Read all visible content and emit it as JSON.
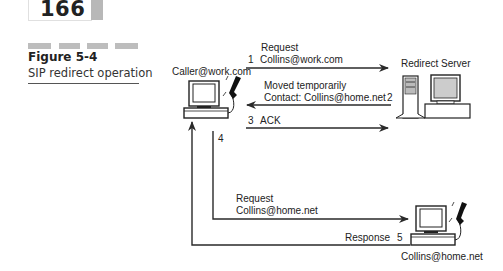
{
  "page": {
    "number": "166"
  },
  "figure": {
    "label": "Figure 5-4",
    "caption": "SIP redirect operation"
  },
  "nodes": {
    "caller": {
      "label": "Caller@work.com",
      "icon": "computer-with-phone-icon"
    },
    "redirect_server": {
      "label": "Redirect Server",
      "icon": "server-tower-icon"
    },
    "callee": {
      "label": "Collins@home.net",
      "icon": "computer-with-phone-icon"
    }
  },
  "messages": [
    {
      "step": "1",
      "line1": "Request",
      "line2": "Collins@work.com",
      "from": "caller",
      "to": "redirect_server"
    },
    {
      "step": "2",
      "line1": "Moved temporarily",
      "line2": "Contact: Collins@home.net",
      "from": "redirect_server",
      "to": "caller"
    },
    {
      "step": "3",
      "line1": "ACK",
      "line2": "",
      "from": "caller",
      "to": "redirect_server"
    },
    {
      "step": "4",
      "line1": "Request",
      "line2": "Collins@home.net",
      "from": "caller",
      "to": "callee"
    },
    {
      "step": "5",
      "line1": "Response",
      "line2": "",
      "from": "callee",
      "to": "caller"
    }
  ],
  "colors": {
    "line": "#2a2a2a",
    "accent_gray": "#bdbdbd"
  }
}
